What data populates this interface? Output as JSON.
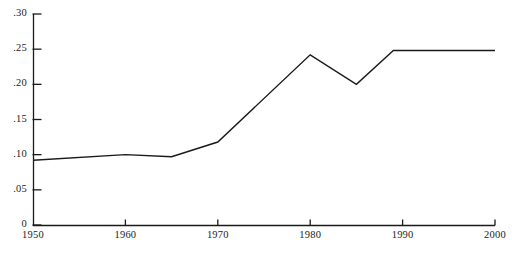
{
  "chart_data": {
    "type": "line",
    "title": "",
    "subtitle": "",
    "xlabel": "",
    "ylabel": "",
    "xlim": [
      1950,
      2000
    ],
    "ylim": [
      0,
      0.3
    ],
    "grid": false,
    "legend": false,
    "legend_position": "none",
    "line_color": "#1a1a1a",
    "axis_color": "#1a1a1a",
    "background_color": "#ffffff",
    "x_ticks": [
      1950,
      1960,
      1970,
      1980,
      1990,
      2000
    ],
    "x_tick_labels": [
      "1950",
      "1960",
      "1970",
      "1980",
      "1990",
      "2000"
    ],
    "y_ticks": [
      0,
      0.05,
      0.1,
      0.15,
      0.2,
      0.25,
      0.3
    ],
    "y_tick_labels": [
      "0",
      ".05",
      ".10",
      ".15",
      ".20",
      ".25",
      ".30"
    ],
    "series": [
      {
        "name": "series-1",
        "x": [
          1950,
          1960,
          1965,
          1970,
          1980,
          1985,
          1989,
          2000
        ],
        "values": [
          0.092,
          0.1,
          0.097,
          0.118,
          0.242,
          0.2,
          0.248,
          0.248
        ]
      }
    ]
  }
}
